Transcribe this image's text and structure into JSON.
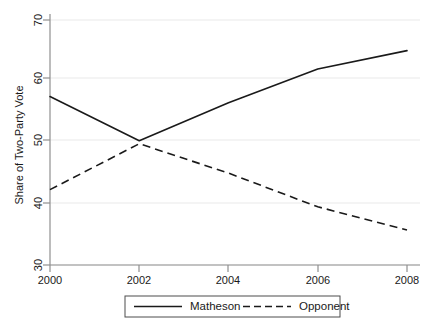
{
  "chart_data": {
    "type": "line",
    "title": "",
    "xlabel": "",
    "ylabel": "Share of Two-Party Vote",
    "x": [
      2000,
      2002,
      2004,
      2006,
      2008
    ],
    "xticklabels": [
      "2000",
      "2002",
      "2004",
      "2006",
      "2008"
    ],
    "yticklabels": [
      "30",
      "40",
      "50",
      "60",
      "70"
    ],
    "yticks": [
      30,
      40,
      50,
      60,
      70
    ],
    "xlim": [
      2000,
      2008
    ],
    "ylim": [
      30,
      70
    ],
    "grid": "horizontal",
    "legend_position": "bottom-outside",
    "series": [
      {
        "name": "Matheson",
        "style": "solid",
        "color": "#1a1a1a",
        "values": [
          57.5,
          50.3,
          56.5,
          62.0,
          65.0
        ]
      },
      {
        "name": "Opponent",
        "style": "dashed",
        "color": "#1a1a1a",
        "values": [
          42.3,
          49.8,
          45.0,
          39.5,
          35.7
        ]
      }
    ]
  },
  "axes": {
    "y_axis_label": "Share of Two-Party Vote",
    "y_tick_labels": [
      "70",
      "60",
      "50",
      "40",
      "30"
    ],
    "x_tick_labels": [
      "2000",
      "2002",
      "2004",
      "2006",
      "2008"
    ]
  },
  "legend": {
    "entries": [
      {
        "label": "Matheson",
        "marker": "solid-line-swatch"
      },
      {
        "label": "Opponent",
        "marker": "dashed-line-swatch"
      }
    ]
  },
  "colors": {
    "line": "#1a1a1a",
    "grid": "#e8e8e8",
    "axis": "#8a8a8a",
    "background": "#ffffff",
    "legend_border": "#4d4d4d"
  }
}
